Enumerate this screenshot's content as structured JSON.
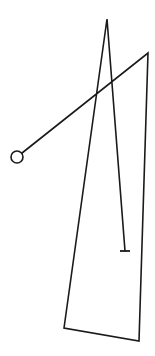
{
  "diagram": {
    "type": "line-drawing",
    "stroke_color": "#1a1a1a",
    "background": "#ffffff",
    "stroke_width": 1.6,
    "start_circle": {
      "cx": 17,
      "cy": 157,
      "r": 6
    },
    "path_points": "17,157 148,53 139,341 64,328 107,19 125,251",
    "end_tick": {
      "x1": 120,
      "y1": 251,
      "x2": 130,
      "y2": 251
    }
  }
}
